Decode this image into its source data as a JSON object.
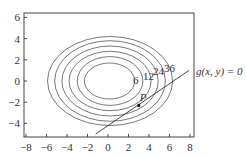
{
  "chart_data": {
    "type": "contour",
    "title": "",
    "xlabel": "",
    "ylabel": "",
    "xlim": [
      -8,
      8
    ],
    "ylim": [
      -5,
      6.5
    ],
    "x_ticks": [
      "−8",
      "−6",
      "−4",
      "−2",
      "0",
      "2",
      "4",
      "6",
      "8"
    ],
    "y_ticks": [
      "6",
      "4",
      "2",
      "0",
      "−2",
      "−4"
    ],
    "contour_levels": [
      6,
      12,
      18,
      24,
      30,
      36
    ],
    "contour_labels": [
      "6",
      "12",
      "24",
      "36"
    ],
    "contours": [
      {
        "rx_left": 2.3,
        "rx_right": 2.6,
        "ry": 1.7
      },
      {
        "rx_left": 3.0,
        "rx_right": 3.4,
        "ry": 2.3
      },
      {
        "rx_left": 3.8,
        "rx_right": 4.2,
        "ry": 2.8
      },
      {
        "rx_left": 4.5,
        "rx_right": 4.9,
        "ry": 3.3
      },
      {
        "rx_left": 5.2,
        "rx_right": 5.6,
        "ry": 3.8
      },
      {
        "rx_left": 5.9,
        "rx_right": 6.3,
        "ry": 4.2
      }
    ],
    "constraint_line": {
      "label": "g(x, y) = 0",
      "from": [
        -1.2,
        -5.0
      ],
      "to": [
        7.9,
        1.0
      ]
    },
    "point": {
      "label": "P",
      "x": 3.0,
      "y": -2.3
    },
    "grid": false
  }
}
